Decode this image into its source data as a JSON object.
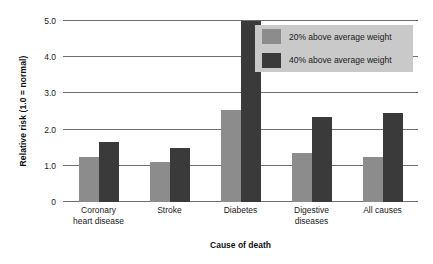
{
  "chart_data": {
    "type": "bar",
    "title": "",
    "xlabel": "Cause of death",
    "ylabel": "Relative risk (1.0 = normal)",
    "categories": [
      "Coronary heart disease",
      "Stroke",
      "Diabetes",
      "Digestive diseases",
      "All causes"
    ],
    "category_lines": [
      [
        "Coronary",
        "heart disease"
      ],
      [
        "Stroke"
      ],
      [
        "Diabetes"
      ],
      [
        "Digestive",
        "diseases"
      ],
      [
        "All causes"
      ]
    ],
    "series": [
      {
        "name": "20% above average weight",
        "color": "#8c8c8c",
        "values": [
          1.25,
          1.1,
          2.55,
          1.35,
          1.25
        ]
      },
      {
        "name": "40% above average weight",
        "color": "#3a3a3a",
        "values": [
          1.65,
          1.5,
          5.0,
          2.35,
          2.45
        ]
      }
    ],
    "ylim": [
      0,
      5.0
    ],
    "yticks": [
      "0",
      "1.0",
      "2.0",
      "3.0",
      "4.0",
      "5.0"
    ],
    "ytick_values": [
      0,
      1.0,
      2.0,
      3.0,
      4.0,
      5.0
    ],
    "grid": true,
    "legend_position": "top-right"
  }
}
